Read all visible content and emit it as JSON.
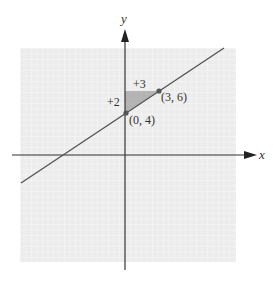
{
  "figure": {
    "x_axis_label": "x",
    "y_axis_label": "y",
    "rise_label": "+2",
    "run_label": "+3",
    "points": [
      {
        "label": "(0, 4)",
        "x": 0,
        "y": 4
      },
      {
        "label": "(3, 6)",
        "x": 3,
        "y": 6
      }
    ],
    "line": {
      "slope": "2/3",
      "y_intercept": 4
    },
    "colors": {
      "grid_bg": "#ececec",
      "grid_line": "#ffffff",
      "line": "#555555",
      "triangle": "#9a9a9a",
      "axis": "#333333"
    }
  }
}
